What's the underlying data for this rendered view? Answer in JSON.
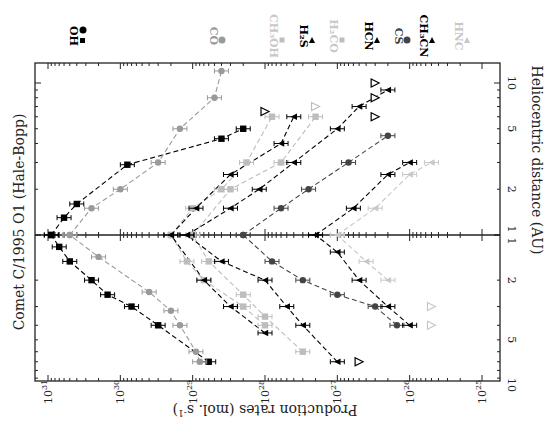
{
  "chart_data": {
    "type": "scatter",
    "title": "Comet C/1995 O1 (Hale-Bopp)",
    "orientation": "rotated-90-clockwise",
    "xlabel": "Heliocentric distance (AU)",
    "ylabel": "Production rates (mol. s^-1)",
    "ylabel_parts": {
      "main": "Production rates (mol. s",
      "sup": "-1",
      "close": ")"
    },
    "yscale": "log",
    "xscale": "log",
    "ylim": [
      1e+25,
      1e+31
    ],
    "x_ticks_pre_perihelion": [
      "10",
      "5",
      "2",
      "1"
    ],
    "x_ticks_post_perihelion": [
      "1",
      "2",
      "5",
      "10"
    ],
    "y_ticks": [
      {
        "base": "10",
        "exp": "31"
      },
      {
        "base": "10",
        "exp": "30"
      },
      {
        "base": "10",
        "exp": "29"
      },
      {
        "base": "10",
        "exp": "28"
      },
      {
        "base": "10",
        "exp": "27"
      },
      {
        "base": "10",
        "exp": "26"
      },
      {
        "base": "10",
        "exp": "25"
      }
    ],
    "grid": false,
    "legend_position": "top (rotated, right of plot)",
    "panels": [
      "pre-perihelion (r decreasing to 1 AU)",
      "post-perihelion (r increasing from 1 AU)"
    ],
    "legend": [
      {
        "name": "OH",
        "marker": "square+circle",
        "color": "#000000"
      },
      {
        "name": "CO",
        "marker": "circle",
        "color": "#9a9a9a"
      },
      {
        "name": "CH3OH",
        "marker": "square",
        "color": "#bdbdbd"
      },
      {
        "name": "H2S",
        "marker": "triangle",
        "color": "#000000"
      },
      {
        "name": "H2CO",
        "marker": "square",
        "color": "#bdbdbd"
      },
      {
        "name": "HCN",
        "marker": "triangle",
        "color": "#000000"
      },
      {
        "name": "CS",
        "marker": "circle",
        "color": "#444444"
      },
      {
        "name": "CH3CN",
        "marker": "triangle",
        "color": "#000000"
      },
      {
        "name": "HNC",
        "marker": "triangle",
        "color": "#c8c8c8"
      }
    ],
    "series": [
      {
        "name": "OH",
        "color": "#000000",
        "marker": "square",
        "pre": [
          [
            7.0,
            6e+28
          ],
          [
            4.0,
            3e+29
          ],
          [
            3.0,
            7e+29
          ],
          [
            2.5,
            1.5e+30
          ],
          [
            2.0,
            2.5e+30
          ],
          [
            1.5,
            5e+30
          ],
          [
            1.2,
            7e+30
          ],
          [
            1.0,
            9e+30
          ]
        ],
        "post": [
          [
            1.0,
            9e+30
          ],
          [
            1.3,
            6e+30
          ],
          [
            1.6,
            4e+30
          ],
          [
            2.9,
            8e+29
          ],
          [
            4.3,
            4e+28
          ],
          [
            5.0,
            2e+28
          ]
        ],
        "upper_limits": [
          [
            6.5,
            1e+28
          ]
        ]
      },
      {
        "name": "CO",
        "color": "#9a9a9a",
        "marker": "circle",
        "pre": [
          [
            7.0,
            8e+28
          ],
          [
            6.0,
            9e+28
          ],
          [
            4.0,
            1.5e+29
          ],
          [
            3.2,
            2e+29
          ],
          [
            2.4,
            4e+29
          ],
          [
            1.4,
            2e+30
          ],
          [
            1.0,
            5e+30
          ]
        ],
        "post": [
          [
            1.0,
            5e+30
          ],
          [
            1.5,
            2.5e+30
          ],
          [
            2.0,
            1e+30
          ],
          [
            3.0,
            3e+29
          ],
          [
            5.0,
            1.5e+29
          ],
          [
            8.0,
            5e+28
          ],
          [
            12.0,
            4e+28
          ]
        ]
      },
      {
        "name": "CH3OH",
        "color": "#bdbdbd",
        "marker": "square",
        "pre": [
          [
            4.0,
            1e+28
          ],
          [
            3.0,
            2e+28
          ],
          [
            2.0,
            7e+28
          ],
          [
            1.5,
            1.2e+29
          ],
          [
            1.0,
            2e+29
          ]
        ],
        "post": [
          [
            1.0,
            2e+29
          ],
          [
            1.5,
            1e+29
          ],
          [
            2.0,
            4e+28
          ],
          [
            3.0,
            1.8e+28
          ],
          [
            6.0,
            8e+27
          ]
        ]
      },
      {
        "name": "H2S",
        "color": "#000000",
        "marker": "triangle",
        "pre": [
          [
            4.5,
            1e+28
          ],
          [
            3.0,
            3e+28
          ],
          [
            2.0,
            7e+28
          ],
          [
            1.0,
            2e+29
          ]
        ],
        "post": [
          [
            1.0,
            2e+29
          ],
          [
            1.5,
            9e+28
          ],
          [
            2.5,
            3e+28
          ],
          [
            4.0,
            6e+27
          ],
          [
            6.0,
            4e+27
          ]
        ]
      },
      {
        "name": "H2CO",
        "color": "#bdbdbd",
        "marker": "square",
        "pre": [
          [
            6.0,
            3e+27
          ],
          [
            3.5,
            1e+28
          ],
          [
            2.5,
            2e+28
          ],
          [
            1.5,
            6e+28
          ],
          [
            1.0,
            1e+29
          ]
        ],
        "post": [
          [
            1.0,
            1e+29
          ],
          [
            2.0,
            3e+28
          ],
          [
            3.0,
            6e+27
          ],
          [
            6.0,
            2e+27
          ]
        ],
        "upper_limits": [
          [
            7.0,
            2e+27
          ]
        ]
      },
      {
        "name": "HCN",
        "color": "#000000",
        "marker": "triangle",
        "pre": [
          [
            7.0,
            1e+27
          ],
          [
            4.0,
            3e+27
          ],
          [
            3.0,
            5e+27
          ],
          [
            2.0,
            1e+28
          ],
          [
            1.5,
            4e+28
          ],
          [
            1.0,
            1.2e+29
          ]
        ],
        "post": [
          [
            1.0,
            1.2e+29
          ],
          [
            1.5,
            3e+28
          ],
          [
            2.0,
            1.2e+28
          ],
          [
            3.0,
            4e+27
          ],
          [
            5.0,
            1e+27
          ],
          [
            7.0,
            5e+26
          ],
          [
            9.0,
            2e+26
          ]
        ],
        "upper_limits": [
          [
            8.0,
            3e+26
          ],
          [
            7.0,
            5e+26
          ],
          [
            10.0,
            3e+26
          ]
        ]
      },
      {
        "name": "CS",
        "color": "#444444",
        "marker": "circle",
        "pre": [
          [
            4.0,
            1.5e+26
          ],
          [
            3.0,
            3e+26
          ],
          [
            2.5,
            1e+27
          ],
          [
            2.0,
            3e+27
          ],
          [
            1.5,
            8e+27
          ],
          [
            1.0,
            2e+28
          ]
        ],
        "post": [
          [
            1.0,
            2e+28
          ],
          [
            1.5,
            6e+27
          ],
          [
            2.0,
            2.5e+27
          ],
          [
            3.0,
            7e+26
          ],
          [
            4.5,
            2e+26
          ]
        ]
      },
      {
        "name": "CH3CN",
        "color": "#000000",
        "marker": "triangle",
        "pre": [
          [
            4.0,
            1e+26
          ],
          [
            3.0,
            2e+26
          ],
          [
            2.0,
            5e+26
          ],
          [
            1.3,
            1e+27
          ],
          [
            1.0,
            2e+27
          ]
        ],
        "post": [
          [
            1.0,
            2e+27
          ],
          [
            1.5,
            6e+26
          ],
          [
            2.5,
            2e+26
          ],
          [
            3.0,
            1e+26
          ]
        ],
        "upper_limits": [
          [
            6.0,
            3e+26
          ]
        ]
      },
      {
        "name": "HNC",
        "color": "#c8c8c8",
        "marker": "triangle",
        "pre": [
          [
            2.0,
            2e+26
          ],
          [
            1.5,
            4e+26
          ],
          [
            1.0,
            1e+27
          ]
        ],
        "post": [
          [
            1.0,
            1e+27
          ],
          [
            1.5,
            3e+26
          ],
          [
            2.5,
            1e+26
          ],
          [
            3.0,
            5e+25
          ]
        ],
        "upper_limits": [
          [
            3.0,
            5e+25
          ],
          [
            4.0,
            5e+25
          ]
        ]
      }
    ]
  }
}
